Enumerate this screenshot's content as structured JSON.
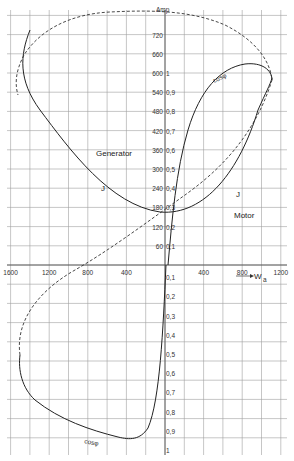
{
  "chart_data": {
    "type": "line",
    "title": "",
    "xlabel": "W_a (KW)",
    "ylabel": "Amp",
    "x_unit": "KW",
    "y_unit": "Amp",
    "x_ticks_negative": [
      3200,
      2800,
      2400,
      2000,
      1600,
      1200,
      800,
      400
    ],
    "x_ticks_positive": [
      400,
      800,
      1200,
      1600,
      2000
    ],
    "x_tick_labels": [
      "3200",
      "2800",
      "2400",
      "2000",
      "1600",
      "1200",
      "800",
      "400",
      "400",
      "800",
      "1200",
      "1600",
      "2000KW"
    ],
    "y_ticks_amp": [
      60,
      120,
      180,
      240,
      300,
      360,
      420,
      480,
      540,
      600,
      660,
      720
    ],
    "y_tick_labels_amp": [
      "60",
      "120",
      "180",
      "240",
      "300",
      "360",
      "420",
      "480",
      "540",
      "600",
      "660",
      "720"
    ],
    "y_ticks_cosphi_upper": [
      0.1,
      0.2,
      0.3,
      0.4,
      0.5,
      0.6,
      0.7,
      0.8,
      0.9,
      1.0
    ],
    "y_ticks_cosphi_lower": [
      0.1,
      0.2,
      0.3,
      0.4,
      0.5,
      0.6,
      0.7,
      0.8,
      0.9,
      1.0
    ],
    "xlim": [
      -3400,
      2200
    ],
    "ylim_amp": [
      0,
      720
    ],
    "grid": true,
    "annotations": [
      "Generator",
      "Motor",
      "J",
      "J",
      "cosφ",
      "cosφ",
      "W_a",
      "Amp"
    ],
    "series": [
      {
        "name": "J (current, Amp)",
        "style": "solid",
        "points": [
          [
            -3150,
            560
          ],
          [
            -3000,
            450
          ],
          [
            -2400,
            320
          ],
          [
            -1600,
            230
          ],
          [
            -800,
            150
          ],
          [
            -400,
            110
          ],
          [
            0,
            80
          ],
          [
            400,
            90
          ],
          [
            800,
            150
          ],
          [
            1200,
            260
          ],
          [
            1600,
            380
          ],
          [
            2000,
            480
          ]
        ]
      },
      {
        "name": "cosφ (upper, motor)",
        "style": "solid",
        "points": [
          [
            0,
            0.0
          ],
          [
            80,
            0.2
          ],
          [
            200,
            0.5
          ],
          [
            400,
            0.75
          ],
          [
            800,
            0.9
          ],
          [
            1200,
            0.98
          ],
          [
            1600,
            0.96
          ],
          [
            2000,
            0.88
          ]
        ]
      },
      {
        "name": "cosφ (lower, generator)",
        "style": "solid",
        "points": [
          [
            0,
            0.0
          ],
          [
            -60,
            -0.3
          ],
          [
            -150,
            -0.6
          ],
          [
            -250,
            -0.8
          ],
          [
            -400,
            -0.95
          ],
          [
            -800,
            -1.0
          ],
          [
            -1600,
            -0.95
          ],
          [
            -2400,
            -0.85
          ],
          [
            -3000,
            -0.7
          ],
          [
            -3250,
            -0.55
          ]
        ]
      },
      {
        "name": "dashed (loop envelope)",
        "style": "dashed",
        "points": [
          [
            -3250,
            0.55
          ],
          [
            -3100,
            0.75
          ],
          [
            -2600,
            0.93
          ],
          [
            -1600,
            1.02
          ],
          [
            0,
            1.04
          ],
          [
            1000,
            1.0
          ],
          [
            1600,
            0.92
          ],
          [
            2000,
            0.8
          ],
          [
            1600,
            0.62
          ],
          [
            800,
            0.4
          ],
          [
            0,
            0.2
          ],
          [
            -800,
            -0.1
          ],
          [
            -1600,
            -0.4
          ],
          [
            -2400,
            -0.7
          ],
          [
            -3000,
            -0.85
          ],
          [
            -3300,
            -0.55
          ]
        ]
      }
    ]
  },
  "labels": {
    "amp": "Amp",
    "generator": "Generator",
    "motor": "Motor",
    "j_left": "J",
    "j_right": "J",
    "cosphi_top": "cosφ",
    "cosphi_bottom": "cosφ",
    "wa": "W",
    "wa_sub": "a",
    "kw": "KW"
  },
  "colors": {
    "grid": "#9a9a9a",
    "curve": "#222222",
    "background": "#ffffff"
  }
}
